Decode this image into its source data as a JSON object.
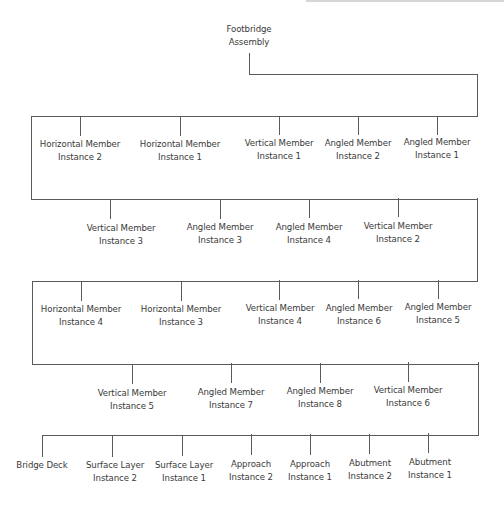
{
  "diagram": {
    "type": "tree",
    "line_color": "#5a5a5a",
    "text_color": "#3a3a3a",
    "root": {
      "line1": "Footbridge",
      "line2": "Assembly"
    },
    "rows": [
      {
        "nodes": [
          {
            "line1": "Horizontal Member",
            "line2": "Instance 2"
          },
          {
            "line1": "Horizontal Member",
            "line2": "Instance 1"
          },
          {
            "line1": "Vertical Member",
            "line2": "Instance 1"
          },
          {
            "line1": "Angled Member",
            "line2": "Instance 2"
          },
          {
            "line1": "Angled Member",
            "line2": "Instance 1"
          }
        ]
      },
      {
        "nodes": [
          {
            "line1": "Vertical Member",
            "line2": "Instance 3"
          },
          {
            "line1": "Angled Member",
            "line2": "Instance 3"
          },
          {
            "line1": "Angled Member",
            "line2": "Instance 4"
          },
          {
            "line1": "Vertical Member",
            "line2": "Instance 2"
          }
        ]
      },
      {
        "nodes": [
          {
            "line1": "Horizontal Member",
            "line2": "Instance 4"
          },
          {
            "line1": "Horizontal Member",
            "line2": "Instance 3"
          },
          {
            "line1": "Vertical Member",
            "line2": "Instance 4"
          },
          {
            "line1": "Angled Member",
            "line2": "Instance 6"
          },
          {
            "line1": "Angled Member",
            "line2": "Instance 5"
          }
        ]
      },
      {
        "nodes": [
          {
            "line1": "Vertical Member",
            "line2": "Instance 5"
          },
          {
            "line1": "Angled Member",
            "line2": "Instance 7"
          },
          {
            "line1": "Angled Member",
            "line2": "Instance 8"
          },
          {
            "line1": "Vertical Member",
            "line2": "Instance 6"
          }
        ]
      },
      {
        "nodes": [
          {
            "line1": "Bridge Deck",
            "line2": ""
          },
          {
            "line1": "Surface Layer",
            "line2": "Instance 2"
          },
          {
            "line1": "Surface Layer",
            "line2": "Instance 1"
          },
          {
            "line1": "Approach",
            "line2": "Instance 2"
          },
          {
            "line1": "Approach",
            "line2": "Instance 1"
          },
          {
            "line1": "Abutment",
            "line2": "Instance 2"
          },
          {
            "line1": "Abutment",
            "line2": "Instance 1"
          }
        ]
      }
    ]
  }
}
